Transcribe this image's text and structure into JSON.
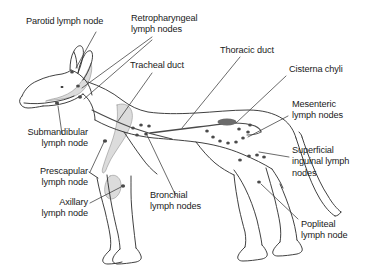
{
  "figure": {
    "background_color": "#ffffff",
    "line_color": "#2b2b2b",
    "leader_color": "#3a3a3a",
    "node_color": "#4a4a4a",
    "shade_color": "#d9d9d9",
    "text_color": "#1a1a1a"
  },
  "labels": {
    "parotid": "Parotid lymph node",
    "retropharyngeal": "Retropharyngeal\nlymph nodes",
    "tracheal_duct": "Tracheal duct",
    "thoracic_duct": "Thoracic duct",
    "cisterna_chyli": "Cisterna chyli",
    "mesenteric": "Mesenteric\nlymph nodes",
    "superficial_inguinal": "Superficial\ninguinal lymph\nnodes",
    "popliteal": "Popliteal\nlymph node",
    "bronchial": "Bronchial\nlymph nodes",
    "axillary": "Axillary\nlymph node",
    "prescapular": "Prescapular\nlymph node",
    "submandibular": "Submandibular\nlymph node"
  },
  "structures": [
    {
      "id": "parotid",
      "name": "Parotid lymph node",
      "kind": "lymph-node",
      "count": 1
    },
    {
      "id": "retropharyngeal",
      "name": "Retropharyngeal lymph nodes",
      "kind": "lymph-node",
      "count": 2
    },
    {
      "id": "submandibular",
      "name": "Submandibular lymph node",
      "kind": "lymph-node",
      "count": 1
    },
    {
      "id": "prescapular",
      "name": "Prescapular lymph node",
      "kind": "lymph-node",
      "count": 1
    },
    {
      "id": "axillary",
      "name": "Axillary lymph node",
      "kind": "lymph-node",
      "count": 1
    },
    {
      "id": "bronchial",
      "name": "Bronchial lymph nodes",
      "kind": "lymph-node",
      "count": 5
    },
    {
      "id": "mesenteric",
      "name": "Mesenteric lymph nodes",
      "kind": "lymph-node",
      "count": 9
    },
    {
      "id": "superficial_inguinal",
      "name": "Superficial inguinal lymph nodes",
      "kind": "lymph-node",
      "count": 4
    },
    {
      "id": "popliteal",
      "name": "Popliteal lymph node",
      "kind": "lymph-node",
      "count": 1
    },
    {
      "id": "tracheal_duct",
      "name": "Tracheal duct",
      "kind": "duct",
      "count": 1
    },
    {
      "id": "thoracic_duct",
      "name": "Thoracic duct",
      "kind": "duct",
      "count": 1
    },
    {
      "id": "cisterna_chyli",
      "name": "Cisterna chyli",
      "kind": "cistern",
      "count": 1
    }
  ]
}
